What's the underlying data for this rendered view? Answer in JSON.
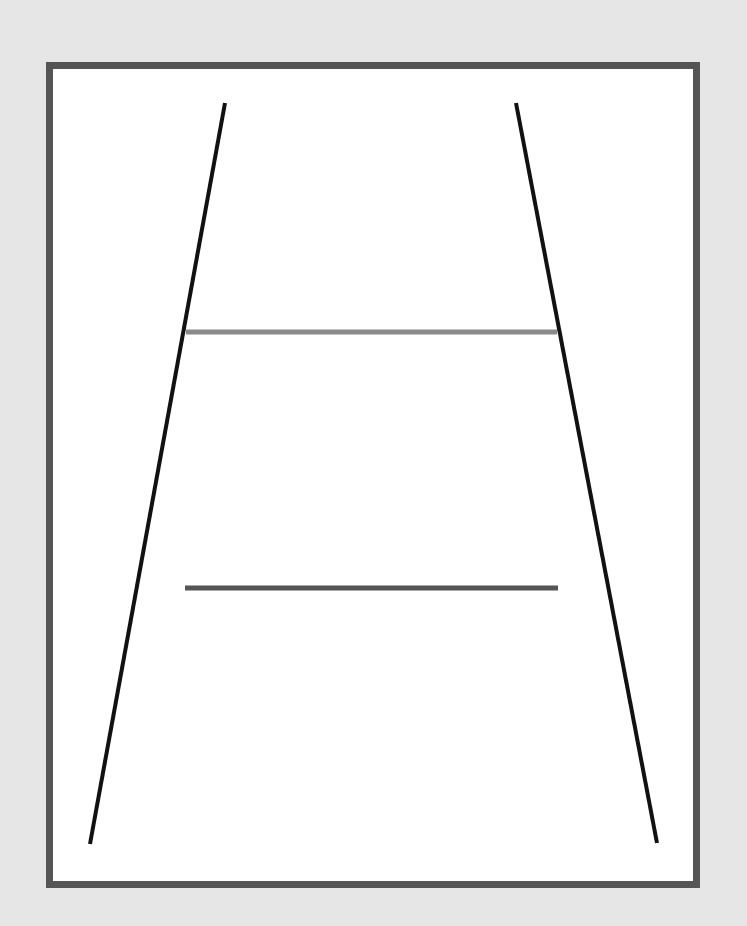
{
  "diagram": {
    "type": "ponzo-illusion",
    "colors": {
      "background": "#e6e6e6",
      "frame_border": "#555555",
      "frame_fill": "#ffffff",
      "converging_lines": "#111111",
      "upper_line": "#8a8a8a",
      "lower_line": "#555555"
    },
    "converging_lines": [
      {
        "x1": 225,
        "y1": 103,
        "x2": 90,
        "y2": 844
      },
      {
        "x1": 516,
        "y1": 103,
        "x2": 657,
        "y2": 843
      }
    ],
    "horizontal_lines": [
      {
        "name": "upper",
        "x1": 186,
        "y1": 332,
        "x2": 557,
        "y2": 332
      },
      {
        "name": "lower",
        "x1": 185,
        "y1": 588,
        "x2": 558,
        "y2": 588
      }
    ]
  }
}
